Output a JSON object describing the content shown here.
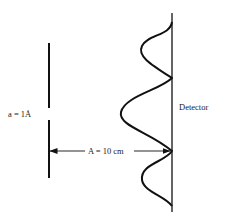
{
  "diagram": {
    "type": "single-slit diffraction",
    "slit_label": "a = 1Å",
    "distance_label": "A = 10 cm",
    "detector_label": "Detector",
    "colors": {
      "stroke": "#111111",
      "background": "#ffffff"
    },
    "elements": {
      "slit_barrier": {
        "x": 49,
        "upper": [
          43,
          108
        ],
        "lower": [
          120,
          178
        ]
      },
      "detector_line": {
        "x": 172,
        "y_range": [
          13,
          212
        ]
      },
      "intensity_pattern": {
        "description": "diffraction intensity curve with central maximum and two side maxima",
        "peaks": [
          {
            "y": 48,
            "x": 141,
            "label": "side maximum"
          },
          {
            "y": 115,
            "x": 121,
            "label": "central maximum"
          },
          {
            "y": 179,
            "x": 141,
            "label": "side maximum"
          }
        ],
        "minima_y": [
          22,
          78,
          151,
          206
        ]
      },
      "distance_arrow": {
        "y": 151,
        "x_from": 50,
        "x_to": 171
      }
    }
  }
}
